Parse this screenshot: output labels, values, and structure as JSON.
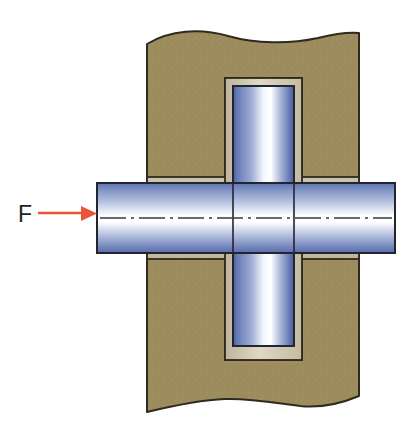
{
  "figure": {
    "background_color": "#ffffff",
    "width": 418,
    "height": 439
  },
  "annotations": {
    "force_label": "F",
    "force_label_x": 18,
    "force_label_y": 226,
    "arrow": {
      "name": "force-arrow",
      "color": "#e8563a",
      "start_x": 38,
      "end_x": 96,
      "y": 213,
      "line_width": 2.4,
      "head_length": 15,
      "head_half_height": 7
    }
  },
  "parts": [
    {
      "name": "housing-block",
      "label": "Housing / support block",
      "fill": "#9d8c5d",
      "stroke": "#2f2a1d",
      "stroke_width": 2,
      "left": 147,
      "right": 359,
      "top": 32,
      "bottom": 406,
      "break_line": "wavy"
    },
    {
      "name": "bushing-sleeve",
      "label": "Bushing / spacer sleeve",
      "fill": "#d0c8af",
      "stroke": "#2f2a1d",
      "stroke_width": 1.8
    },
    {
      "name": "vertical-plate",
      "label": "Vertical plate / tongue",
      "fill_start": "#5f70ab",
      "fill_mid": "#ffffff",
      "fill_end": "#4f619e",
      "stroke": "#22242e",
      "stroke_width": 2,
      "left": 233,
      "right": 294,
      "top": 86,
      "bottom": 346
    },
    {
      "name": "horizontal-shaft",
      "label": "Horizontal shaft / pin",
      "fill_start": "#6c7fba",
      "fill_mid": "#ffffff",
      "fill_end": "#5a6eac",
      "stroke": "#22242e",
      "stroke_width": 2,
      "left": 97,
      "right": 395,
      "top": 183,
      "bottom": 253
    },
    {
      "name": "centerline",
      "label": "Axis centerline",
      "stroke": "#3a3a3a",
      "stroke_width": 1.3,
      "style": "dash-dot",
      "y": 218,
      "start_x": 100,
      "end_x": 392
    }
  ],
  "colors": {
    "housing": "#9d8c5d",
    "bushing": "#d0c8af",
    "plate_blue": "#5f70ab",
    "shaft_blue": "#6c7fba",
    "outline": "#2f2a1d",
    "arrow_red": "#e8563a",
    "text": "#231f20",
    "background": "#ffffff"
  }
}
